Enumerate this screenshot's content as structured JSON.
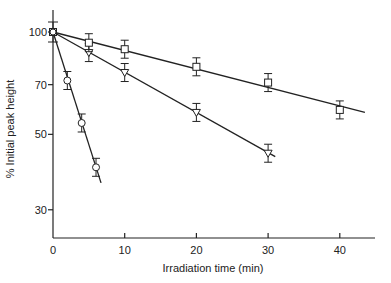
{
  "chart_data": {
    "type": "scatter",
    "title": "",
    "xlabel": "Irradiation time (min)",
    "ylabel": "% Initial peak height",
    "xlim": [
      0,
      45
    ],
    "ylim": [
      25,
      115
    ],
    "yscale": "log",
    "grid": false,
    "legend": "none",
    "x_ticks": [
      0,
      10,
      20,
      30,
      40
    ],
    "x_tick_labels": [
      "0",
      "10",
      "20",
      "30",
      "40"
    ],
    "y_ticks": [
      100,
      70,
      50,
      30
    ],
    "y_tick_labels": [
      "100",
      "70",
      "50",
      "30"
    ],
    "series": [
      {
        "name": "circles",
        "marker": "circle",
        "x": [
          0,
          2,
          4,
          6
        ],
        "y": [
          100,
          72,
          54,
          40
        ],
        "fit_line": {
          "x": [
            0,
            6.7
          ],
          "y": [
            100,
            36
          ]
        }
      },
      {
        "name": "triangles",
        "marker": "triangle-down",
        "x": [
          0,
          5,
          10,
          20,
          30
        ],
        "y": [
          100,
          87,
          76,
          58,
          44
        ],
        "fit_line": {
          "x": [
            0,
            31
          ],
          "y": [
            100,
            43
          ]
        }
      },
      {
        "name": "squares",
        "marker": "square",
        "x": [
          0,
          5,
          10,
          20,
          30,
          40
        ],
        "y": [
          100,
          93,
          89,
          79,
          71,
          59
        ],
        "fit_line": {
          "x": [
            0,
            43.5
          ],
          "y": [
            100,
            58
          ]
        }
      }
    ]
  }
}
